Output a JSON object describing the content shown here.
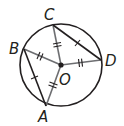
{
  "diagram": {
    "type": "circle-geometry",
    "center": {
      "label": "O"
    },
    "points": [
      {
        "label": "A"
      },
      {
        "label": "B"
      },
      {
        "label": "C"
      },
      {
        "label": "D"
      }
    ],
    "radii": [
      {
        "from": "O",
        "to": "A",
        "tick_marks": 2
      },
      {
        "from": "O",
        "to": "B",
        "tick_marks": 2
      },
      {
        "from": "O",
        "to": "C",
        "tick_marks": 2
      },
      {
        "from": "O",
        "to": "D",
        "tick_marks": 2
      }
    ],
    "chords": [
      {
        "from": "B",
        "to": "A",
        "tick_marks": 1
      },
      {
        "from": "C",
        "to": "D",
        "tick_marks": 1
      }
    ],
    "colors": {
      "stroke": "#231f20",
      "radius": "#6d6e71"
    }
  }
}
